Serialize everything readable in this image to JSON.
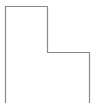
{
  "diagram": {
    "shape": "l-shaped-outline",
    "stroke_color": "#8a8a8a",
    "background": "#ffffff"
  }
}
